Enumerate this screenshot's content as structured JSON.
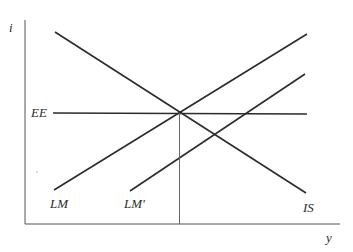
{
  "diagram": {
    "type": "IS-LM-EE",
    "axes": {
      "y_label": "i",
      "x_label": "y"
    },
    "curves": [
      {
        "id": "IS",
        "label": "IS",
        "slope": "downward",
        "x1": 55,
        "y1": 32,
        "x2": 306,
        "y2": 193
      },
      {
        "id": "LM",
        "label": "LM",
        "slope": "upward",
        "x1": 54,
        "y1": 190,
        "x2": 307,
        "y2": 34
      },
      {
        "id": "LMp",
        "label": "LM'",
        "slope": "upward",
        "x1": 130,
        "y1": 191,
        "x2": 305,
        "y2": 74
      },
      {
        "id": "EE",
        "label": "EE",
        "slope": "horizontal",
        "x1": 53,
        "y1": 113,
        "x2": 307,
        "y2": 114
      }
    ],
    "equilibrium": {
      "x": 180,
      "y": 113,
      "drop_line_to_axis": true
    },
    "colors": {
      "line": "#2b2b2b",
      "axis": "#555555",
      "background": "#ffffff"
    }
  }
}
